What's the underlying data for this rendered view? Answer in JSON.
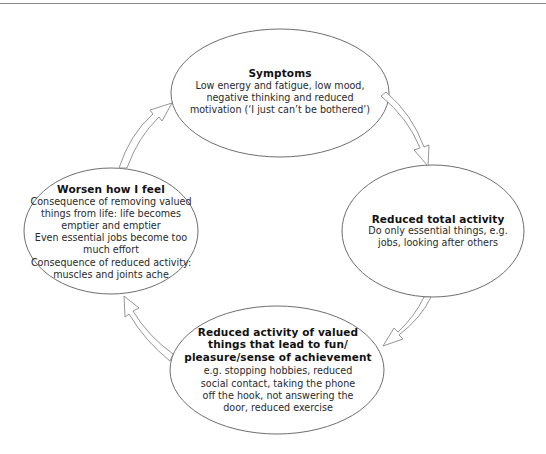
{
  "diagram": {
    "type": "cycle",
    "colors": {
      "stroke": "#6e6e6e",
      "text": "#1a1a1a",
      "background": "#ffffff"
    },
    "nodes": [
      {
        "id": "symptoms",
        "title_lines": [
          "Symptoms"
        ],
        "body_lines": [
          "Low energy and fatigue, low mood,",
          "negative thinking and reduced",
          "motivation (‘I just can’t be bothered’)"
        ]
      },
      {
        "id": "reduced-total-activity",
        "title_lines": [
          "Reduced total activity"
        ],
        "body_lines": [
          "Do only essential things, e.g.",
          "jobs, looking after others"
        ]
      },
      {
        "id": "reduced-valued-activity",
        "title_lines": [
          "Reduced activity of valued",
          "things that lead to fun/",
          "pleasure/sense of achievement"
        ],
        "body_lines": [
          "e.g. stopping hobbies, reduced",
          "social contact, taking the phone",
          "off the hook, not answering the",
          "door, reduced exercise"
        ]
      },
      {
        "id": "worsen-how-i-feel",
        "title_lines": [
          "Worsen how I feel"
        ],
        "body_lines": [
          "Consequence of removing valued",
          "things from life: life becomes",
          "emptier and emptier",
          "Even essential jobs become too",
          "much effort",
          "Consequence of reduced activity:",
          "muscles and joints ache"
        ]
      }
    ],
    "edges": [
      {
        "from": "symptoms",
        "to": "reduced-total-activity"
      },
      {
        "from": "reduced-total-activity",
        "to": "reduced-valued-activity"
      },
      {
        "from": "reduced-valued-activity",
        "to": "worsen-how-i-feel"
      },
      {
        "from": "worsen-how-i-feel",
        "to": "symptoms"
      }
    ]
  }
}
